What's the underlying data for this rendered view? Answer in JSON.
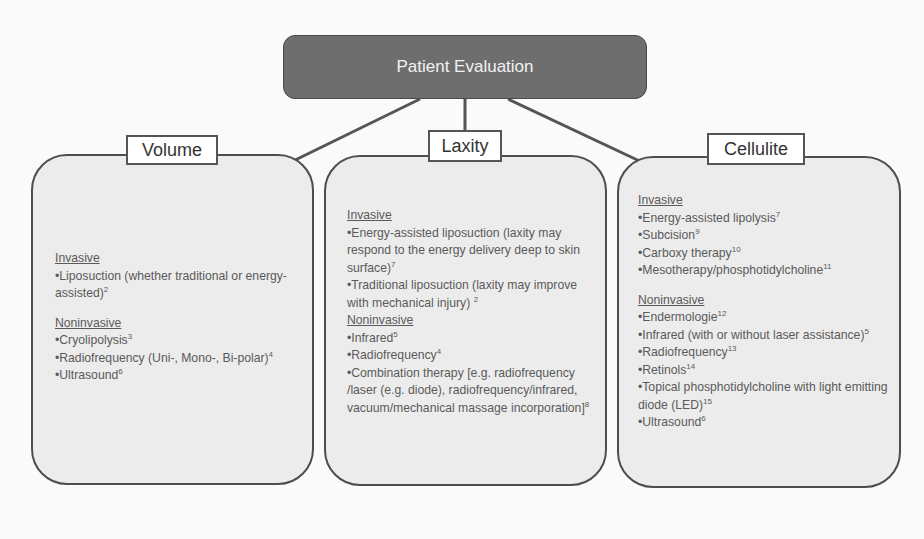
{
  "root": {
    "label": "Patient Evaluation"
  },
  "colors": {
    "root_fill": "#6e6e6e",
    "panel_fill": "#ececec",
    "border": "#4d4d4d",
    "connector": "#555555"
  },
  "panels": [
    {
      "title": "Volume",
      "sections": [
        {
          "heading": "Invasive",
          "items": [
            {
              "text": "Liposuction (whether traditional or energy-assisted)",
              "ref": "2"
            }
          ]
        },
        {
          "heading": "Noninvasive",
          "items": [
            {
              "text": "Cryolipolysis",
              "ref": "3"
            },
            {
              "text": "Radiofrequency (Uni-, Mono-, Bi-polar)",
              "ref": "4"
            },
            {
              "text": "Ultrasound",
              "ref": "6"
            }
          ]
        }
      ]
    },
    {
      "title": "Laxity",
      "sections": [
        {
          "heading": "Invasive",
          "items": [
            {
              "text": "Energy-assisted liposuction (laxity may respond to the energy delivery deep to skin surface)",
              "ref": "7"
            },
            {
              "text": "Traditional liposuction (laxity may improve with mechanical injury)",
              "ref": "2"
            }
          ]
        },
        {
          "heading": "Noninvasive",
          "items": [
            {
              "text": "Infrared",
              "ref": "5"
            },
            {
              "text": "Radiofrequency",
              "ref": "4"
            },
            {
              "text": "Combination therapy [e.g. radiofrequency /laser (e.g. diode), radiofrequency/infrared, vacuum/mechanical massage incorporation]",
              "ref": "8"
            }
          ]
        }
      ]
    },
    {
      "title": "Cellulite",
      "sections": [
        {
          "heading": "Invasive",
          "items": [
            {
              "text": "Energy-assisted lipolysis",
              "ref": "7"
            },
            {
              "text": "Subcision",
              "ref": "9"
            },
            {
              "text": "Carboxy therapy",
              "ref": "10"
            },
            {
              "text": "Mesotherapy/phosphotidylcholine",
              "ref": "11"
            }
          ]
        },
        {
          "heading": "Noninvasive",
          "items": [
            {
              "text": "Endermologie",
              "ref": "12"
            },
            {
              "text": "Infrared (with or without laser assistance)",
              "ref": "5"
            },
            {
              "text": "Radiofrequency",
              "ref": "13"
            },
            {
              "text": "Retinols",
              "ref": "14"
            },
            {
              "text": "Topical phosphotidylcholine with light emitting diode (LED)",
              "ref": "15"
            },
            {
              "text": "Ultrasound",
              "ref": "6"
            }
          ]
        }
      ]
    }
  ]
}
